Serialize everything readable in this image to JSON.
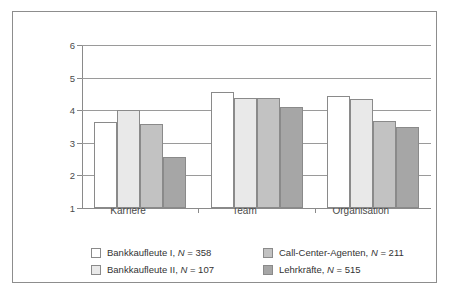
{
  "chart_data": {
    "type": "bar",
    "title": "",
    "subtitle": "",
    "xlabel": "",
    "ylabel": "",
    "categories": [
      "Karriere",
      "Team",
      "Organisation"
    ],
    "ylim": [
      1,
      6
    ],
    "yticks": [
      1,
      2,
      3,
      4,
      5,
      6
    ],
    "ytick_labels": [
      "1",
      "2",
      "3",
      "4",
      "5",
      "6"
    ],
    "grid": "horizontal",
    "legend_position": "bottom",
    "series": [
      {
        "name": "Bankkaufleute I, N = 358",
        "label": "Bankkaufleute I,",
        "n_label": "N",
        "n_value": "= 358",
        "color": "#ffffff",
        "values": [
          3.64,
          4.57,
          4.45
        ]
      },
      {
        "name": "Bankkaufleute II, N = 107",
        "label": "Bankkaufleute II,",
        "n_label": "N",
        "n_value": "= 107",
        "color": "#e9e9e9",
        "values": [
          4.0,
          4.38,
          4.35
        ]
      },
      {
        "name": "Call-Center-Agenten, N = 211",
        "label": "Call-Center-Agenten,",
        "n_label": "N",
        "n_value": "= 211",
        "color": "#c2c2c2",
        "values": [
          3.59,
          4.37,
          3.68
        ]
      },
      {
        "name": "Lehrkräfte, N = 515",
        "label": "Lehrkräfte,",
        "n_label": "N",
        "n_value": "= 515",
        "color": "#a6a6a6",
        "values": [
          2.57,
          4.09,
          3.5
        ]
      }
    ]
  },
  "axis": {
    "ytick_labels": [
      "6",
      "5",
      "4",
      "3",
      "2",
      "1"
    ]
  },
  "legend": {
    "items": [
      {
        "label": "Bankkaufleute I,",
        "n_label": "N",
        "n_value": "= 358",
        "swatch": "s0"
      },
      {
        "label": "Bankkaufleute II,",
        "n_label": "N",
        "n_value": "= 107",
        "swatch": "s1"
      },
      {
        "label": "Call-Center-Agenten,",
        "n_label": "N",
        "n_value": "= 211",
        "swatch": "s2"
      },
      {
        "label": "Lehrkräfte,",
        "n_label": "N",
        "n_value": "= 515",
        "swatch": "s3"
      }
    ]
  },
  "colors": {
    "series0": "#ffffff",
    "series1": "#e9e9e9",
    "series2": "#c2c2c2",
    "series3": "#a6a6a6",
    "axis": "#8a8a8a",
    "grid": "#9a9a9a",
    "frame": "#8d8d8d",
    "text": "#4a4a4a"
  }
}
